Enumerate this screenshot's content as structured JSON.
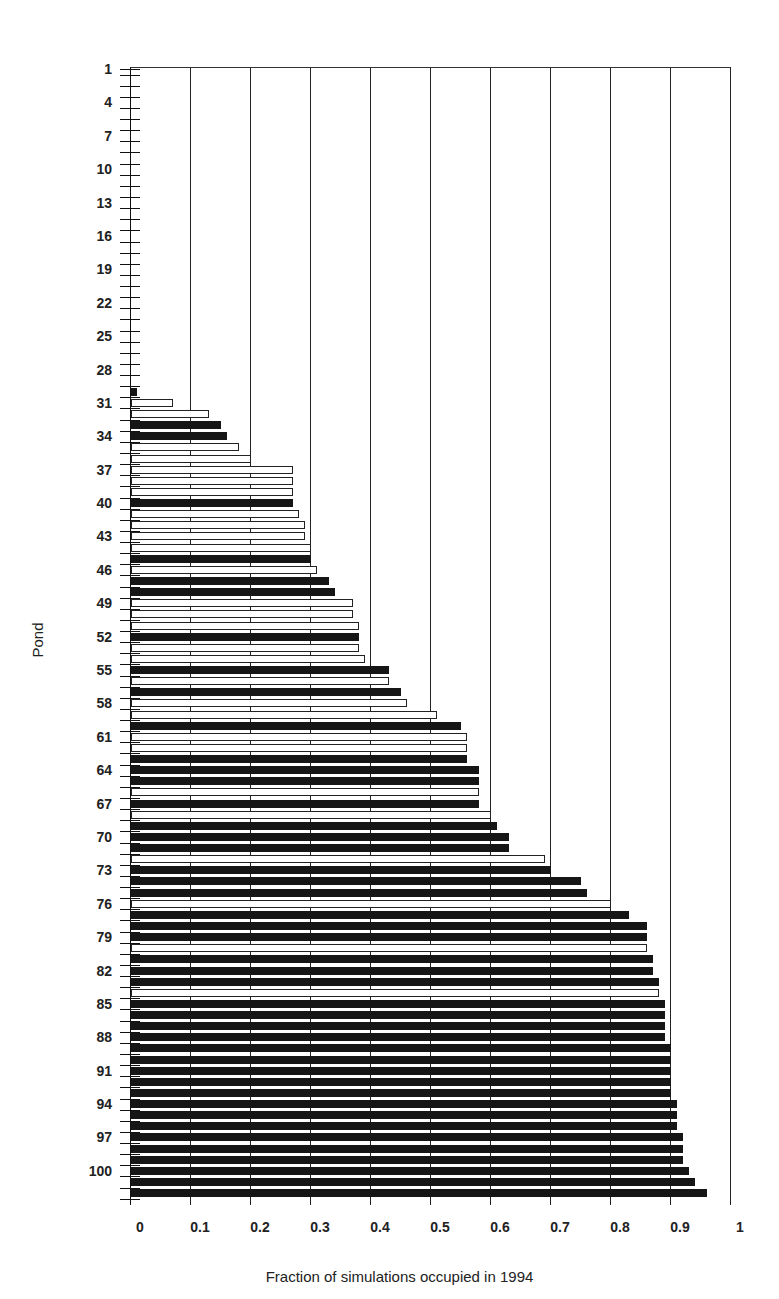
{
  "chart_data": {
    "type": "bar",
    "orientation": "horizontal",
    "title": "",
    "xlabel": "Fraction of simulations occupied in 1994",
    "ylabel": "Pond",
    "xlim": [
      0,
      1
    ],
    "x_ticks": [
      "0",
      "0.1",
      "0.2",
      "0.3",
      "0.4",
      "0.5",
      "0.6",
      "0.7",
      "0.8",
      "0.9",
      "1"
    ],
    "y_tick_labels": [
      "1",
      "4",
      "7",
      "10",
      "13",
      "16",
      "19",
      "22",
      "25",
      "28",
      "31",
      "34",
      "37",
      "40",
      "43",
      "46",
      "49",
      "52",
      "55",
      "58",
      "61",
      "64",
      "67",
      "70",
      "73",
      "76",
      "79",
      "82",
      "85",
      "88",
      "91",
      "94",
      "97",
      "100"
    ],
    "grid": "vertical lines at each 0.1",
    "legend": "none (bar fill black vs white distinguishes two pond classes)",
    "categories": [
      30,
      31,
      32,
      33,
      34,
      35,
      36,
      37,
      38,
      39,
      40,
      41,
      42,
      43,
      44,
      45,
      46,
      47,
      48,
      49,
      50,
      51,
      52,
      53,
      54,
      55,
      56,
      57,
      58,
      59,
      60,
      61,
      62,
      63,
      64,
      65,
      66,
      67,
      68,
      69,
      70,
      71,
      72,
      73,
      74,
      75,
      76,
      77,
      78,
      79,
      80,
      81,
      82,
      83,
      84,
      85,
      86,
      87,
      88,
      89,
      90,
      91,
      92,
      93,
      94,
      95,
      96,
      97,
      98,
      99,
      100,
      101,
      102
    ],
    "values": [
      0.01,
      0.07,
      0.13,
      0.15,
      0.16,
      0.18,
      0.2,
      0.27,
      0.27,
      0.27,
      0.27,
      0.28,
      0.29,
      0.29,
      0.3,
      0.3,
      0.31,
      0.33,
      0.34,
      0.37,
      0.37,
      0.38,
      0.38,
      0.38,
      0.39,
      0.43,
      0.43,
      0.45,
      0.46,
      0.51,
      0.55,
      0.56,
      0.56,
      0.56,
      0.58,
      0.58,
      0.58,
      0.58,
      0.6,
      0.61,
      0.63,
      0.63,
      0.69,
      0.7,
      0.75,
      0.76,
      0.8,
      0.83,
      0.86,
      0.86,
      0.86,
      0.87,
      0.87,
      0.88,
      0.88,
      0.89,
      0.89,
      0.89,
      0.89,
      0.9,
      0.9,
      0.9,
      0.9,
      0.9,
      0.91,
      0.91,
      0.91,
      0.92,
      0.92,
      0.92,
      0.93,
      0.94,
      0.96
    ],
    "fills": [
      "black",
      "white",
      "white",
      "black",
      "black",
      "white",
      "white",
      "white",
      "white",
      "white",
      "black",
      "white",
      "white",
      "white",
      "white",
      "black",
      "white",
      "black",
      "black",
      "white",
      "white",
      "white",
      "black",
      "white",
      "white",
      "black",
      "white",
      "black",
      "white",
      "white",
      "black",
      "white",
      "white",
      "black",
      "black",
      "black",
      "white",
      "black",
      "white",
      "black",
      "black",
      "black",
      "white",
      "black",
      "black",
      "black",
      "white",
      "black",
      "black",
      "black",
      "white",
      "black",
      "black",
      "black",
      "white",
      "black",
      "black",
      "black",
      "black",
      "black",
      "black",
      "black",
      "black",
      "black",
      "black",
      "black",
      "black",
      "black",
      "black",
      "black",
      "black",
      "black",
      "black"
    ],
    "ponds_total": 102,
    "ponds_with_zero": "1-29"
  }
}
